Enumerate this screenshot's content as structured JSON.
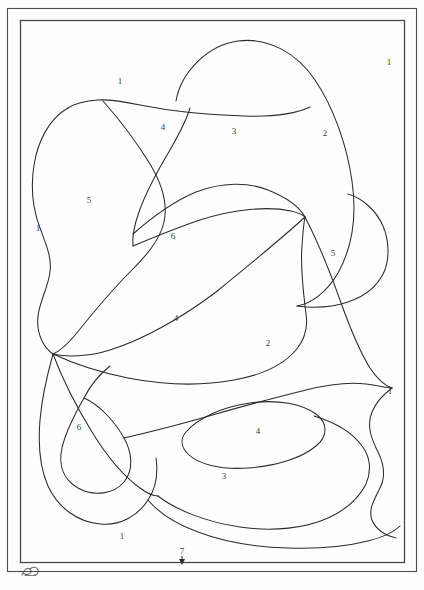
{
  "figure": {
    "background_color": "#fefefe",
    "ink_color": "#2b2b2b",
    "frame_color": "#4a4a4a"
  },
  "frame": {
    "outer": {
      "x": 7,
      "y": 8,
      "width": 410,
      "height": 564
    },
    "inner": {
      "x": 20,
      "y": 20,
      "width": 385,
      "height": 543
    }
  },
  "region_labels": [
    {
      "id": "label-1-top",
      "text": "1",
      "x": 120,
      "y": 81
    },
    {
      "id": "label-1-top-right",
      "text": "1",
      "x": 389,
      "y": 62
    },
    {
      "id": "label-4-upper",
      "text": "4",
      "x": 163,
      "y": 127
    },
    {
      "id": "label-3-upper",
      "text": "3",
      "x": 234,
      "y": 131
    },
    {
      "id": "label-2-upper",
      "text": "2",
      "x": 325,
      "y": 133
    },
    {
      "id": "label-5-left",
      "text": "5",
      "x": 89,
      "y": 200
    },
    {
      "id": "label-1-left",
      "text": "1",
      "x": 38,
      "y": 228
    },
    {
      "id": "label-6-center",
      "text": "6",
      "x": 173,
      "y": 236
    },
    {
      "id": "label-5-right",
      "text": "5",
      "x": 333,
      "y": 253
    },
    {
      "id": "label-4-center",
      "text": "4",
      "x": 176,
      "y": 318
    },
    {
      "id": "label-2-lower",
      "text": "2",
      "x": 268,
      "y": 343
    },
    {
      "id": "label-1-right",
      "text": "1",
      "x": 390,
      "y": 391
    },
    {
      "id": "label-6-lower-left",
      "text": "6",
      "x": 79,
      "y": 427
    },
    {
      "id": "label-4-lower",
      "text": "4",
      "x": 258,
      "y": 431
    },
    {
      "id": "label-3-lower",
      "text": "3",
      "x": 224,
      "y": 476
    },
    {
      "id": "label-1-bottom",
      "text": "1",
      "x": 122,
      "y": 536
    }
  ],
  "annotation": {
    "marker_label": "7",
    "marker_label_x": 182,
    "marker_label_y": 552,
    "pointer_x": 182,
    "pointer_top_y": 556,
    "pointer_bottom_y": 565,
    "description": "Numbered tick marker with downward pointer at bottom edge of inner frame"
  },
  "signature": {
    "present": true,
    "description": "small ink monogram below bottom-left of inner frame"
  },
  "legend": {
    "region_numbers": [
      "1",
      "2",
      "3",
      "4",
      "5",
      "6",
      "7"
    ],
    "note": "Numbers identify distinct mapped zones"
  }
}
